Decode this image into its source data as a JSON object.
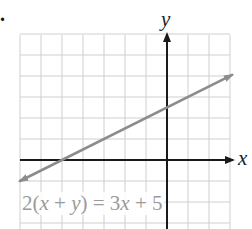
{
  "problem": {
    "number_marker": "."
  },
  "axes": {
    "x_label": "x",
    "y_label": "y"
  },
  "equation": {
    "text": "2(x + y) = 3x + 5",
    "parts": [
      "2(",
      "x",
      " + ",
      "y",
      ") = 3",
      "x",
      " + 5"
    ]
  },
  "colors": {
    "grid": "#cfcfcf",
    "axis": "#1a1a1a",
    "line": "#8c8c8c",
    "equation_text": "#9a9a9a"
  },
  "chart_data": {
    "type": "line",
    "title": "",
    "xlabel": "x",
    "ylabel": "y",
    "annotation": "2(x + y) = 3x + 5",
    "equation_slope_intercept": "y = 0.5x + 2.5",
    "slope": 0.5,
    "y_intercept": 2.5,
    "x_intercept": -5,
    "xlim": [
      -7,
      3
    ],
    "ylim": [
      -3,
      6
    ],
    "grid": true,
    "grid_step": 1,
    "tick_labels_shown": false,
    "series": [
      {
        "name": "2(x + y) = 3x + 5",
        "x": [
          -7,
          -5,
          0,
          3.1
        ],
        "y": [
          -1,
          0,
          2.5,
          4.05
        ],
        "arrows": "both"
      }
    ]
  }
}
